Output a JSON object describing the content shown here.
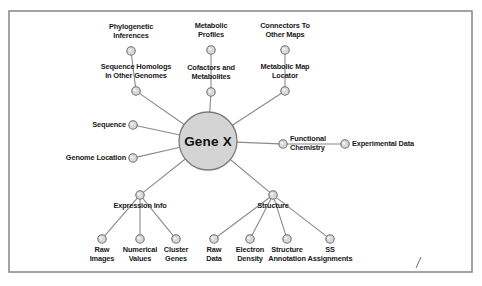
{
  "figure": {
    "center_node": {
      "label": "Gene X",
      "cx": 208,
      "cy": 141,
      "r": 29,
      "fill": "#d4d4d4",
      "stroke": "#7a7a7a"
    },
    "border": {
      "x": 9,
      "y": 11,
      "width": 463,
      "height": 261,
      "stroke": "#8c8c8c"
    },
    "colors": {
      "node_fill": "#d9d9d9",
      "node_stroke": "#6e6e6e",
      "edge": "#8a8a8a",
      "text": "#1a1a1a",
      "background": "#ffffff"
    },
    "node_radius": 4.2,
    "corner_mark": {
      "label": "/",
      "x1": 421,
      "y1": 257,
      "x2": 416,
      "y2": 268
    }
  },
  "nodes": [
    {
      "id": "phylogenetic-inferences",
      "label": "Phylogenetic\nInferences",
      "cx": 131,
      "cy": 51,
      "lx": 131,
      "ly": 23,
      "align": "center"
    },
    {
      "id": "metabolic-profiles",
      "label": "Metabolic\nProfiles",
      "cx": 211,
      "cy": 50,
      "lx": 211,
      "ly": 22,
      "align": "center"
    },
    {
      "id": "connectors-to-other-maps",
      "label": "Connectors To\nOther Maps",
      "cx": 285,
      "cy": 50,
      "lx": 285,
      "ly": 22,
      "align": "center"
    },
    {
      "id": "sequence-homologs",
      "label": "Sequence Homologs\nIn Other Genomes",
      "cx": 136,
      "cy": 91,
      "lx": 136,
      "ly": 63,
      "align": "center"
    },
    {
      "id": "cofactors-and-metabolites",
      "label": "Cofactors and\nMetabolites",
      "cx": 211,
      "cy": 92,
      "lx": 211,
      "ly": 64,
      "align": "center"
    },
    {
      "id": "metabolic-map-locator",
      "label": "Metabolic Map\nLocator",
      "cx": 285,
      "cy": 91,
      "lx": 285,
      "ly": 63,
      "align": "center"
    },
    {
      "id": "sequence",
      "label": "Sequence",
      "cx": 133,
      "cy": 125,
      "lx": 126,
      "ly": 121,
      "align": "right"
    },
    {
      "id": "genome-location",
      "label": "Genome Location",
      "cx": 133,
      "cy": 158,
      "lx": 126,
      "ly": 154,
      "align": "right"
    },
    {
      "id": "functional-chemistry",
      "label": "Functional\nChemistry",
      "cx": 283,
      "cy": 144,
      "lx": 290,
      "ly": 135,
      "align": "left"
    },
    {
      "id": "experimental-data",
      "label": "Experimental Data",
      "cx": 345,
      "cy": 144,
      "lx": 352,
      "ly": 140,
      "align": "left"
    },
    {
      "id": "expression-info",
      "label": "Expression Info",
      "cx": 140,
      "cy": 195,
      "lx": 140,
      "ly": 202,
      "align": "center"
    },
    {
      "id": "structure",
      "label": "Structure",
      "cx": 273,
      "cy": 195,
      "lx": 273,
      "ly": 202,
      "align": "center"
    },
    {
      "id": "raw-images",
      "label": "Raw\nImages",
      "cx": 102,
      "cy": 239,
      "lx": 102,
      "ly": 246,
      "align": "center"
    },
    {
      "id": "numerical-values",
      "label": "Numerical\nValues",
      "cx": 140,
      "cy": 239,
      "lx": 140,
      "ly": 246,
      "align": "center"
    },
    {
      "id": "cluster-genes",
      "label": "Cluster\nGenes",
      "cx": 176,
      "cy": 239,
      "lx": 176,
      "ly": 246,
      "align": "center"
    },
    {
      "id": "raw-data",
      "label": "Raw\nData",
      "cx": 214,
      "cy": 239,
      "lx": 214,
      "ly": 246,
      "align": "center"
    },
    {
      "id": "electron-density",
      "label": "Electron\nDensity",
      "cx": 250,
      "cy": 239,
      "lx": 250,
      "ly": 246,
      "align": "center"
    },
    {
      "id": "structure-annotation",
      "label": "Structure\nAnnotation",
      "cx": 287,
      "cy": 239,
      "lx": 287,
      "ly": 246,
      "align": "center"
    },
    {
      "id": "ss-assignments",
      "label": "SS\nAssignments",
      "cx": 330,
      "cy": 239,
      "lx": 330,
      "ly": 246,
      "align": "center"
    }
  ],
  "edges": [
    {
      "from": "center",
      "to": "sequence-homologs"
    },
    {
      "from": "center",
      "to": "cofactors-and-metabolites"
    },
    {
      "from": "center",
      "to": "metabolic-map-locator"
    },
    {
      "from": "center",
      "to": "sequence"
    },
    {
      "from": "center",
      "to": "genome-location"
    },
    {
      "from": "center",
      "to": "functional-chemistry"
    },
    {
      "from": "center",
      "to": "expression-info"
    },
    {
      "from": "center",
      "to": "structure"
    },
    {
      "from": "sequence-homologs",
      "to": "phylogenetic-inferences"
    },
    {
      "from": "cofactors-and-metabolites",
      "to": "metabolic-profiles"
    },
    {
      "from": "metabolic-map-locator",
      "to": "connectors-to-other-maps"
    },
    {
      "from": "functional-chemistry",
      "to": "experimental-data"
    },
    {
      "from": "expression-info",
      "to": "raw-images"
    },
    {
      "from": "expression-info",
      "to": "numerical-values"
    },
    {
      "from": "expression-info",
      "to": "cluster-genes"
    },
    {
      "from": "structure",
      "to": "raw-data"
    },
    {
      "from": "structure",
      "to": "electron-density"
    },
    {
      "from": "structure",
      "to": "structure-annotation"
    },
    {
      "from": "structure",
      "to": "ss-assignments"
    }
  ]
}
